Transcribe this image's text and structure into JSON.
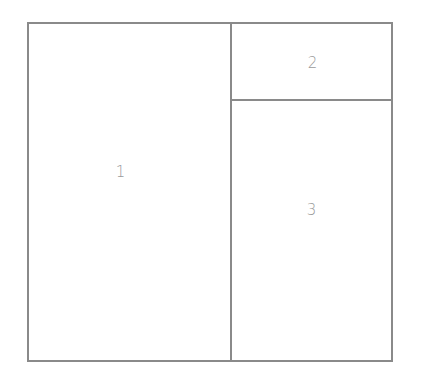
{
  "diagram": {
    "type": "layout-grid",
    "panels": [
      {
        "id": "1",
        "label": "1",
        "position": "left",
        "span": "full-height"
      },
      {
        "id": "2",
        "label": "2",
        "position": "top-right"
      },
      {
        "id": "3",
        "label": "3",
        "position": "bottom-right"
      }
    ],
    "colors": {
      "border": "#8a8a8a",
      "label": "#9a9a9a",
      "background": "#ffffff"
    }
  }
}
